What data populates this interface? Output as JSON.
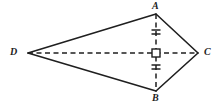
{
  "figure": {
    "kind": "geometry-diagram",
    "shape_name": "kite",
    "width": 218,
    "height": 107,
    "background_color": "#ffffff",
    "stroke_color": "#1f1f1f"
  },
  "labels": {
    "a": "A",
    "b": "B",
    "c": "C",
    "d": "D"
  },
  "chart_data": {
    "type": "scatter",
    "title": "",
    "xlabel": "",
    "ylabel": "",
    "grid": false,
    "legend": "none",
    "xlim": [
      0,
      218
    ],
    "ylim": [
      107,
      0
    ],
    "points": [
      {
        "name": "A",
        "x": 156,
        "y": 14,
        "label": "A",
        "label_position": "above"
      },
      {
        "name": "B",
        "x": 156,
        "y": 91,
        "label": "B",
        "label_position": "below"
      },
      {
        "name": "C",
        "x": 198,
        "y": 53,
        "label": "C",
        "label_position": "right"
      },
      {
        "name": "D",
        "x": 28,
        "y": 53,
        "label": "D",
        "label_position": "left"
      },
      {
        "name": "P",
        "x": 156,
        "y": 53,
        "label": "",
        "label_position": "none"
      }
    ],
    "segments": [
      {
        "name": "DA",
        "from": "D",
        "to": "A",
        "style": "solid",
        "x1": 28,
        "y1": 53,
        "x2": 156,
        "y2": 14
      },
      {
        "name": "AC",
        "from": "A",
        "to": "C",
        "style": "solid",
        "x1": 156,
        "y1": 14,
        "x2": 198,
        "y2": 53
      },
      {
        "name": "CB",
        "from": "C",
        "to": "B",
        "style": "solid",
        "x1": 198,
        "y1": 53,
        "x2": 156,
        "y2": 91
      },
      {
        "name": "BD",
        "from": "B",
        "to": "D",
        "style": "solid",
        "x1": 156,
        "y1": 91,
        "x2": 28,
        "y2": 53
      },
      {
        "name": "DC",
        "from": "D",
        "to": "C",
        "style": "dashed",
        "x1": 28,
        "y1": 53,
        "x2": 198,
        "y2": 53
      },
      {
        "name": "AB",
        "from": "A",
        "to": "B",
        "style": "dashed",
        "x1": 156,
        "y1": 14,
        "x2": 156,
        "y2": 91
      }
    ],
    "tick_marks": [
      {
        "name": "tick-AP-1",
        "on_segment": "AP",
        "count": 2,
        "x": 156,
        "y": 30,
        "orientation": "horizontal",
        "length": 9
      },
      {
        "name": "tick-AP-2",
        "on_segment": "AP",
        "count": 2,
        "x": 156,
        "y": 34,
        "orientation": "horizontal",
        "length": 9
      },
      {
        "name": "tick-PB-1",
        "on_segment": "PB",
        "count": 2,
        "x": 156,
        "y": 65,
        "orientation": "horizontal",
        "length": 9
      },
      {
        "name": "tick-PB-2",
        "on_segment": "PB",
        "count": 2,
        "x": 156,
        "y": 69,
        "orientation": "horizontal",
        "length": 9
      }
    ],
    "angle_markers": [
      {
        "name": "right-angle-P",
        "type": "right-angle",
        "at": "P",
        "x": 156,
        "y": 53,
        "size": 8
      }
    ]
  }
}
